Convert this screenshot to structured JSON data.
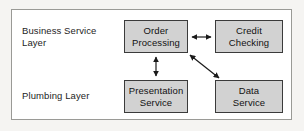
{
  "diagram": {
    "frame": {
      "border_color": "#9a9a96",
      "background": "#ffffff"
    },
    "page_background": "#f5f4f2",
    "node_fill": "#d2d2d2",
    "node_border": "#3b3b3b",
    "connector_color": "#1a1a1a",
    "layers": [
      {
        "id": "business-service-layer",
        "label": "Business Service\nLayer"
      },
      {
        "id": "plumbing-layer",
        "label": "Plumbing Layer"
      }
    ],
    "nodes": [
      {
        "id": "order-processing",
        "label": "Order\nProcessing",
        "layer": "business-service-layer"
      },
      {
        "id": "credit-checking",
        "label": "Credit\nChecking",
        "layer": "business-service-layer"
      },
      {
        "id": "presentation-service",
        "label": "Presentation\nService",
        "layer": "plumbing-layer"
      },
      {
        "id": "data-service",
        "label": "Data\nService",
        "layer": "plumbing-layer"
      }
    ],
    "connectors": [
      {
        "id": "order-processing-to-credit-checking",
        "from": "order-processing",
        "to": "credit-checking",
        "style": "double-arrow",
        "orientation": "horizontal"
      },
      {
        "id": "order-processing-to-presentation-service",
        "from": "order-processing",
        "to": "presentation-service",
        "style": "double-arrow",
        "orientation": "vertical"
      },
      {
        "id": "order-processing-to-data-service",
        "from": "order-processing",
        "to": "data-service",
        "style": "double-arrow",
        "orientation": "diagonal"
      }
    ]
  }
}
